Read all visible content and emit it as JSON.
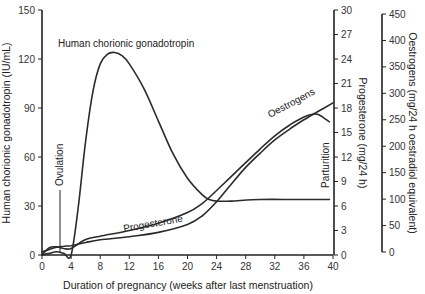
{
  "chart_data": {
    "type": "line",
    "title": "",
    "xlabel": "Duration of pregnancy (weeks after last menstruation)",
    "xlim": [
      0,
      40
    ],
    "xticks": [
      0,
      4,
      8,
      12,
      16,
      20,
      24,
      28,
      32,
      36,
      40
    ],
    "axes": {
      "left": {
        "label": "Human chorionic gonadotropin (IU/mL)",
        "ylim": [
          0,
          150
        ],
        "ticks": [
          0,
          30,
          60,
          90,
          120,
          150
        ]
      },
      "right_inner": {
        "label": "Progesterone (mg/24 h)",
        "ylim": [
          0,
          30
        ],
        "ticks": [
          0,
          3,
          6,
          9,
          12,
          15,
          18,
          21,
          24,
          27,
          30
        ]
      },
      "right_outer": {
        "label": "Oestrogens (mg/24 h oestradiol equivalent)",
        "ylim": [
          0,
          450
        ],
        "ticks": [
          0,
          50,
          100,
          150,
          200,
          250,
          300,
          350,
          400,
          450
        ]
      }
    },
    "grid": false,
    "legend": "inline labels",
    "series": [
      {
        "name": "Human chorionic gonadotropin",
        "axis": "left",
        "x": [
          0,
          1,
          2,
          3,
          4,
          5,
          6,
          7,
          8,
          9,
          10,
          11,
          12,
          14,
          16,
          18,
          20,
          22,
          23,
          24,
          26,
          30,
          35,
          39.5
        ],
        "values": [
          0,
          1,
          2,
          1,
          0,
          30,
          70,
          100,
          117,
          123,
          124,
          122,
          117,
          102,
          82,
          62,
          47,
          37,
          34,
          33,
          33,
          34,
          34,
          34
        ]
      },
      {
        "name": "Progesterone",
        "axis": "right_inner",
        "x": [
          0,
          1,
          2,
          3,
          4,
          6,
          8,
          12,
          16,
          20,
          22,
          24,
          26,
          28,
          30,
          32,
          34,
          36,
          37,
          38,
          39.5
        ],
        "values": [
          0,
          0.9,
          1.0,
          0.8,
          0.8,
          1.9,
          2.3,
          3.0,
          3.9,
          5.2,
          6.3,
          7.9,
          9.6,
          11.3,
          13.0,
          14.6,
          15.9,
          16.9,
          17.2,
          17.2,
          16.3
        ]
      },
      {
        "name": "Oestrogens",
        "axis": "right_outer",
        "x": [
          0,
          1,
          2,
          3,
          4,
          6,
          8,
          12,
          16,
          20,
          22,
          24,
          26,
          28,
          30,
          32,
          34,
          36,
          38,
          40
        ],
        "values": [
          0,
          5,
          9,
          11,
          12,
          18,
          23,
          29,
          37,
          52,
          68,
          95,
          128,
          160,
          187,
          212,
          232,
          250,
          266,
          282
        ]
      }
    ],
    "annotations": [
      {
        "text": "Ovulation",
        "x": 2.5,
        "orientation": "vertical"
      },
      {
        "text": "Parturition",
        "x": 39.5,
        "orientation": "vertical"
      },
      {
        "text": "Human chorionic gonadotropin",
        "x": 11,
        "y": 132
      },
      {
        "text": "Progesterone",
        "x": 15,
        "series": "Progesterone"
      },
      {
        "text": "Oestrogens",
        "x": 32,
        "series": "Oestrogens"
      }
    ]
  },
  "labels": {
    "xlabel": "Duration of pregnancy (weeks after last menstruation)",
    "left_ylabel": "Human chorionic gonadotropin (IU/mL)",
    "prog_ylabel": "Progesterone (mg/24 h)",
    "oest_ylabel": "Oestrogens (mg/24 h oestradiol equivalent)",
    "hcg_label": "Human chorionic gonadotropin",
    "prog_label": "Progesterone",
    "oest_label": "Oestrogens",
    "ovulation": "Ovulation",
    "parturition": "Parturition"
  }
}
